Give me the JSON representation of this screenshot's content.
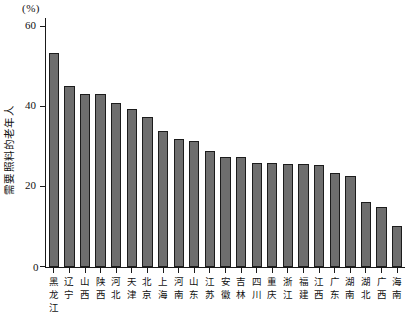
{
  "chart_data": {
    "type": "bar",
    "title": "",
    "subtitle": "",
    "unit_label": "(%)",
    "xlabel": "",
    "ylabel": "需要照料的老年人",
    "ylim": [
      0,
      60
    ],
    "yticks": [
      0,
      20,
      40,
      60
    ],
    "ytick_labels": [
      "0",
      "20",
      "40",
      "60"
    ],
    "grid": false,
    "legend": null,
    "bar_color": "#6e6e6e",
    "bar_edge_color": "#1c1c1c",
    "axis_color": "#1a1a1a",
    "background_color": "#ffffff",
    "categories": [
      "黑龙江",
      "辽宁",
      "山西",
      "陕西",
      "河北",
      "天津",
      "北京",
      "上海",
      "河南",
      "山东",
      "江苏",
      "安徽",
      "吉林",
      "四川",
      "重庆",
      "浙江",
      "福建",
      "江西",
      "广东",
      "湖南",
      "湖北",
      "广西",
      "海南"
    ],
    "values": [
      53.5,
      45.3,
      43.2,
      43.2,
      41.0,
      39.5,
      37.5,
      34.0,
      31.9,
      31.5,
      29.0,
      27.6,
      27.4,
      26.0,
      26.0,
      25.7,
      25.7,
      25.5,
      23.4,
      22.8,
      16.2,
      15.0,
      10.3
    ]
  }
}
